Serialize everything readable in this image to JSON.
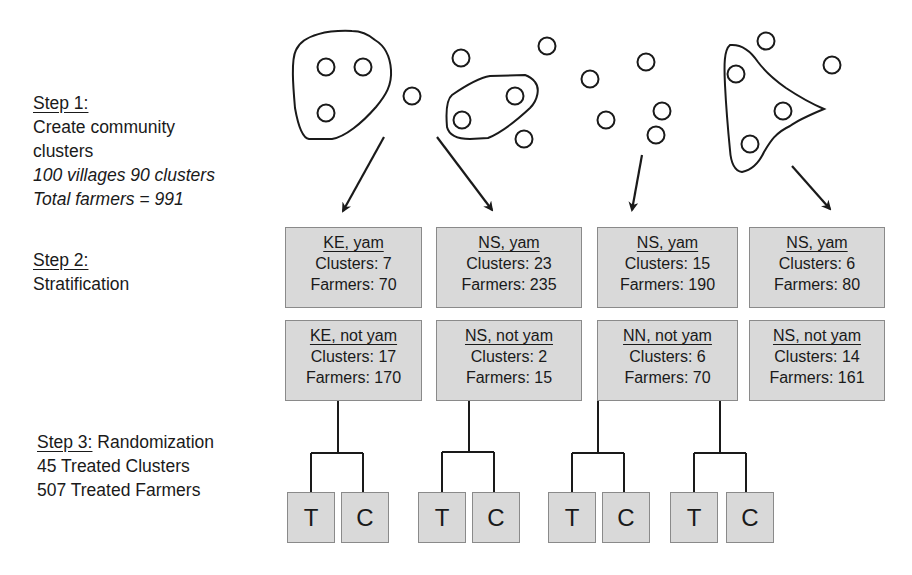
{
  "steps": {
    "step1": {
      "label": "Step 1:",
      "title_line1": "Create community",
      "title_line2": "clusters",
      "note1": "100 villages 90 clusters",
      "note2": "Total farmers = 991"
    },
    "step2": {
      "label": "Step 2:",
      "title": "Stratification"
    },
    "step3": {
      "label": "Step 3:",
      "title": " Randomization",
      "line1": "45 Treated Clusters",
      "line2": "507 Treated Farmers"
    }
  },
  "strata_top": [
    {
      "name": "KE, yam",
      "clusters": "Clusters: 7",
      "farmers": "Farmers: 70"
    },
    {
      "name": "NS, yam",
      "clusters": "Clusters: 23",
      "farmers": "Farmers: 235"
    },
    {
      "name": "NS, yam",
      "clusters": "Clusters: 15",
      "farmers": "Farmers: 190"
    },
    {
      "name": "NS, yam",
      "clusters": "Clusters: 6",
      "farmers": "Farmers: 80"
    }
  ],
  "strata_bottom": [
    {
      "name": "KE, not yam",
      "clusters": "Clusters: 17",
      "farmers": "Farmers: 170"
    },
    {
      "name": "NS, not yam",
      "clusters": "Clusters: 2",
      "farmers": "Farmers: 15"
    },
    {
      "name": "NN, not yam",
      "clusters": "Clusters: 6",
      "farmers": "Farmers: 70"
    },
    {
      "name": "NS, not yam",
      "clusters": "Clusters: 14",
      "farmers": "Farmers: 161"
    }
  ],
  "arms": {
    "treatment": "T",
    "control": "C"
  },
  "colors": {
    "box_fill": "#d9d9d9",
    "box_border": "#8a8a8a",
    "line": "#1a1a1a"
  }
}
